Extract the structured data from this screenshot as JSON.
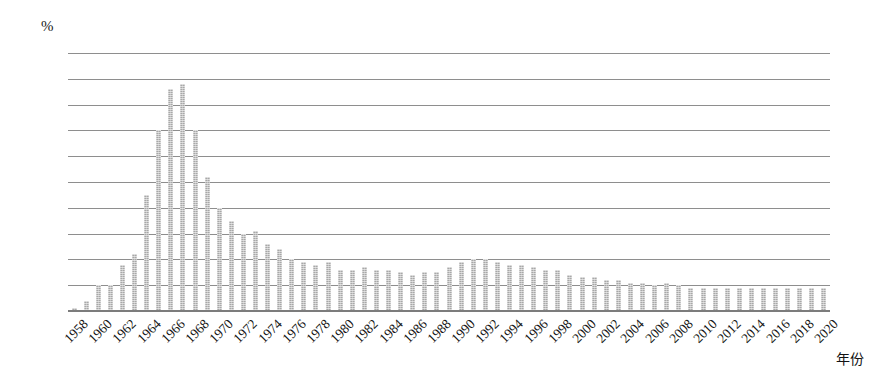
{
  "chart_data": {
    "type": "bar",
    "title": "",
    "xlabel": "年份",
    "ylabel": "%",
    "y_unit_label": "%",
    "ylim": [
      0,
      5
    ],
    "ytick_values": [
      0,
      0.5,
      1,
      1.5,
      2,
      2.5,
      3,
      3.5,
      4,
      4.5,
      5
    ],
    "ytick_labels": [
      "0",
      "0.5",
      "1",
      "1.5",
      "2",
      "2.5",
      "3",
      "3.5",
      "4",
      "4.5",
      "5"
    ],
    "grid": "horizontal",
    "legend": "none",
    "bar_color": "#a8a8a8",
    "xtick_step": 2,
    "xtick_labels": [
      "1958",
      "1960",
      "1962",
      "1964",
      "1966",
      "1968",
      "1970",
      "1972",
      "1974",
      "1976",
      "1978",
      "1980",
      "1982",
      "1984",
      "1986",
      "1988",
      "1990",
      "1992",
      "1994",
      "1996",
      "1998",
      "2000",
      "2002",
      "2004",
      "2006",
      "2008",
      "2010",
      "2012",
      "2014",
      "2016",
      "2018",
      "2020"
    ],
    "categories": [
      1958,
      1959,
      1960,
      1961,
      1962,
      1963,
      1964,
      1965,
      1966,
      1967,
      1968,
      1969,
      1970,
      1971,
      1972,
      1973,
      1974,
      1975,
      1976,
      1977,
      1978,
      1979,
      1980,
      1981,
      1982,
      1983,
      1984,
      1985,
      1986,
      1987,
      1988,
      1989,
      1990,
      1991,
      1992,
      1993,
      1994,
      1995,
      1996,
      1997,
      1998,
      1999,
      2000,
      2001,
      2002,
      2003,
      2004,
      2005,
      2006,
      2007,
      2008,
      2009,
      2010,
      2011,
      2012,
      2013,
      2014,
      2015,
      2016,
      2017,
      2018,
      2019,
      2020
    ],
    "values": [
      0.05,
      0.2,
      0.5,
      0.5,
      0.9,
      1.1,
      2.25,
      3.5,
      4.3,
      4.4,
      3.5,
      2.6,
      2.0,
      1.75,
      1.5,
      1.55,
      1.3,
      1.2,
      1.0,
      0.95,
      0.9,
      0.95,
      0.8,
      0.8,
      0.85,
      0.8,
      0.8,
      0.75,
      0.7,
      0.75,
      0.75,
      0.85,
      0.95,
      1.0,
      1.0,
      0.95,
      0.9,
      0.9,
      0.85,
      0.8,
      0.8,
      0.7,
      0.65,
      0.65,
      0.6,
      0.6,
      0.55,
      0.55,
      0.5,
      0.55,
      0.5,
      0.45,
      0.45,
      0.45,
      0.45,
      0.45,
      0.45,
      0.45,
      0.45,
      0.45,
      0.45,
      0.45,
      0.45
    ]
  }
}
